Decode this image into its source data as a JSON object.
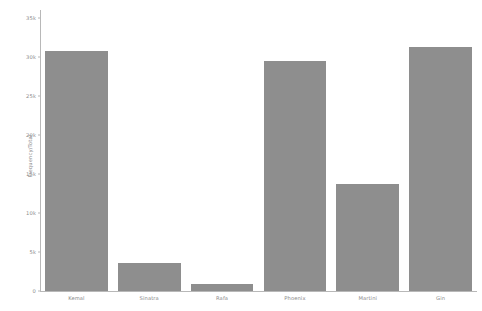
{
  "chart_data": {
    "type": "bar",
    "title": "",
    "xlabel": "",
    "ylabel": "Frequency/Total",
    "categories": [
      "Kemal",
      "Sinatra",
      "Rafa",
      "Phoenix",
      "Martini",
      "Gin"
    ],
    "values": [
      30700,
      3600,
      900,
      29500,
      13750,
      31250
    ],
    "ylim": [
      0,
      36000
    ],
    "yticks": [
      0,
      5000,
      10000,
      15000,
      20000,
      25000,
      30000,
      35000
    ],
    "ytick_labels": [
      "0",
      "5k",
      "10k",
      "15k",
      "20k",
      "25k",
      "30k",
      "35k"
    ],
    "grid": false,
    "legend": null,
    "bar_color": "#8e8e8e",
    "axis_color": "#b8b8b8",
    "text_color": "#8a8a8a",
    "background": "#ffffff"
  }
}
